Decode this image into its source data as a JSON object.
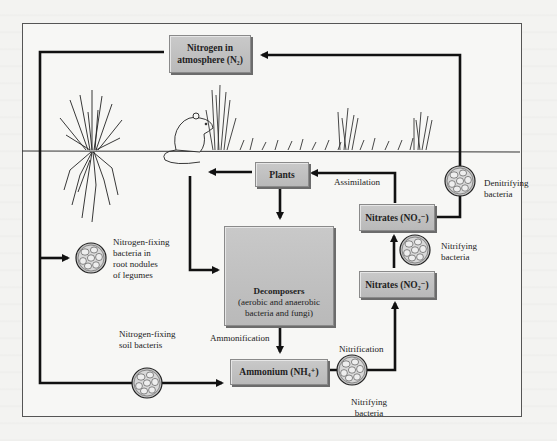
{
  "diagram": {
    "nodes": {
      "atmosphere": {
        "line1": "Nitrogen in",
        "line2": "atmosphere (N₂)"
      },
      "plants": {
        "label": "Plants"
      },
      "decomposers": {
        "title": "Decomposers",
        "line1": "(aerobic and anaerobic",
        "line2": "bacteria and fungi)"
      },
      "nitrates_no3": {
        "label": "Nitrates (NO₃⁻)"
      },
      "nitrates_no2": {
        "label": "Nitrates (NO₂⁻)"
      },
      "ammonium": {
        "label": "Ammonium (NH₄⁺)"
      }
    },
    "labels": {
      "assimilation": "Assimilation",
      "ammonification": "Ammonification",
      "nitrification": "Nitrification",
      "denitrifying": {
        "line1": "Denitrifying",
        "line2": "bacteria"
      },
      "nitrifying_upper": {
        "line1": "Nitrifying",
        "line2": "bacteria"
      },
      "nitrifying_lower": {
        "line1": "Nitrifying",
        "line2": "bacteria"
      },
      "nfix_legumes": {
        "line1": "Nitrogen-fixing",
        "line2": "bacteria in",
        "line3": "root nodules",
        "line4": "of legumes"
      },
      "nfix_soil": {
        "line1": "Nitrogen-fixing",
        "line2": "soil bacteris"
      }
    },
    "icons": [
      "bacteria-cluster-icon",
      "mushroom-icon",
      "grass-plant-icon",
      "mouse-icon"
    ],
    "colors": {
      "box_fill": "#c2c2c2",
      "box_border": "#8a8a8a",
      "line": "#111111",
      "background": "#f7f7f5"
    }
  }
}
